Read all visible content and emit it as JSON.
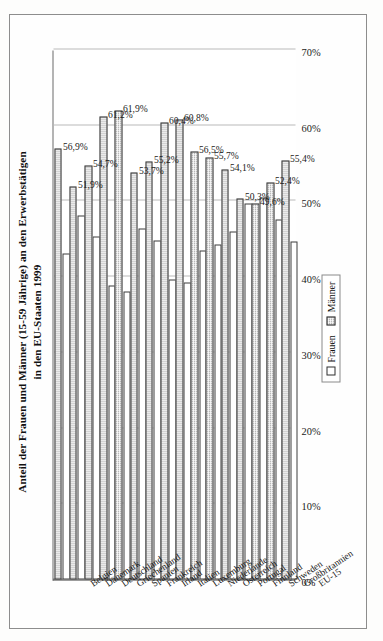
{
  "figure": {
    "title_line1": "Anteil der Frauen und Männer (15-59 Jährige) an den Erwerbstätigen",
    "title_line2": "in den EU-Staaten 1999"
  },
  "legend": {
    "frauen_label": "Frauen",
    "maenner_label": "Männer",
    "frauen_color": "#ffffff",
    "maenner_color": "#b9b9b9"
  },
  "chart_data": {
    "type": "bar",
    "title": "Anteil der Frauen und Männer (15-59 Jährige) an den Erwerbstätigen in den EU-Staaten 1999",
    "orientation": "horizontal",
    "categories": [
      "Belgien",
      "Dänemark",
      "Deutschland",
      "Griechenland",
      "Spanien",
      "Frankreich",
      "Irland",
      "Italien",
      "Luxemburg",
      "Niederlande",
      "Österreich",
      "Portugal",
      "Finnland",
      "Schweden",
      "Großbritannien",
      "EU-15"
    ],
    "series": [
      {
        "name": "Frauen",
        "values": [
          43.1,
          48.1,
          45.3,
          38.8,
          38.1,
          46.3,
          44.8,
          39.6,
          39.2,
          43.5,
          44.3,
          45.9,
          49.7,
          50.4,
          47.6,
          44.6
        ]
      },
      {
        "name": "Männer",
        "values": [
          56.9,
          51.9,
          54.7,
          61.2,
          61.9,
          53.7,
          55.2,
          60.4,
          60.8,
          56.5,
          55.7,
          54.1,
          50.3,
          49.6,
          52.4,
          55.4
        ]
      }
    ],
    "data_labels": [
      "56,9%",
      "51,9%",
      "54,7%",
      "61,2%",
      "61,9%",
      "53,7%",
      "55,2%",
      "60,4%",
      "60,8%",
      "56,5%",
      "55,7%",
      "54,1%",
      "50,3%",
      "49,6%",
      "52,4%",
      "55,4%"
    ],
    "ticks": [
      "0%",
      "10%",
      "20%",
      "30%",
      "40%",
      "50%",
      "60%",
      "70%"
    ],
    "tick_values": [
      0,
      10,
      20,
      30,
      40,
      50,
      60,
      70
    ],
    "xlabel": "",
    "ylabel": "",
    "xlim": [
      0,
      70
    ],
    "grid": true,
    "legend_position": "bottom-right"
  }
}
